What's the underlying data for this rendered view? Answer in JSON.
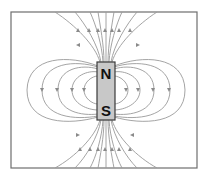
{
  "diagram": {
    "title": "",
    "type": "magnetic-field-lines-bar-magnet",
    "magnet": {
      "north_label": "N",
      "south_label": "S",
      "fill_color": "#c8c8c8",
      "border_color": "#3a3a3a"
    },
    "field_line_color": "#9a9a9a",
    "frame_color": "#6e6e6e",
    "side_loops_per_side": 4,
    "arrow_direction_side_loops": "down",
    "arrow_direction_axial_lines": "up"
  }
}
